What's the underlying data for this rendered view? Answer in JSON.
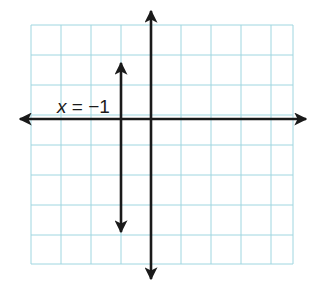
{
  "diagram": {
    "type": "coordinate-plane-graph",
    "grid": {
      "columns": 9,
      "rows": 8,
      "color": "#9fd6e0",
      "left_px": 31,
      "top_px": 25,
      "cell_px": 30
    },
    "axes": {
      "color": "#1a1a1a",
      "x_axis_y_px": 119,
      "y_axis_x_px": 151
    },
    "lines": [
      {
        "equation": "x = −1",
        "label_var": "x",
        "label_rest": " = −1",
        "x_value": -1,
        "x_px": 121,
        "top_px": 62,
        "bottom_px": 233
      }
    ]
  }
}
